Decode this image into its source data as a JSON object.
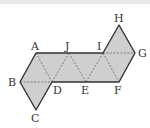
{
  "diagram": {
    "type": "net-of-octahedron",
    "colors": {
      "fill": "#cfcfcf",
      "edge": "#333333",
      "fold": "#666666",
      "label": "#333333"
    },
    "points": {
      "A": [
        36,
        53
      ],
      "J": [
        69,
        53
      ],
      "I": [
        103,
        53
      ],
      "G": [
        135,
        53
      ],
      "H": [
        119,
        25
      ],
      "B": [
        20,
        82
      ],
      "D": [
        52,
        82
      ],
      "E": [
        86,
        82
      ],
      "F": [
        119,
        82
      ],
      "C": [
        36,
        110
      ]
    },
    "labels": [
      {
        "id": "A",
        "text": "A",
        "x": 31,
        "y": 50
      },
      {
        "id": "J",
        "text": "J",
        "x": 65,
        "y": 50
      },
      {
        "id": "I",
        "text": "I",
        "x": 97,
        "y": 50
      },
      {
        "id": "H",
        "text": "H",
        "x": 114,
        "y": 22
      },
      {
        "id": "G",
        "text": "G",
        "x": 138,
        "y": 57
      },
      {
        "id": "B",
        "text": "B",
        "x": 8,
        "y": 86
      },
      {
        "id": "D",
        "text": "D",
        "x": 53,
        "y": 94
      },
      {
        "id": "E",
        "text": "E",
        "x": 81,
        "y": 94
      },
      {
        "id": "F",
        "text": "F",
        "x": 114,
        "y": 94
      },
      {
        "id": "C",
        "text": "C",
        "x": 31,
        "y": 122
      }
    ]
  }
}
